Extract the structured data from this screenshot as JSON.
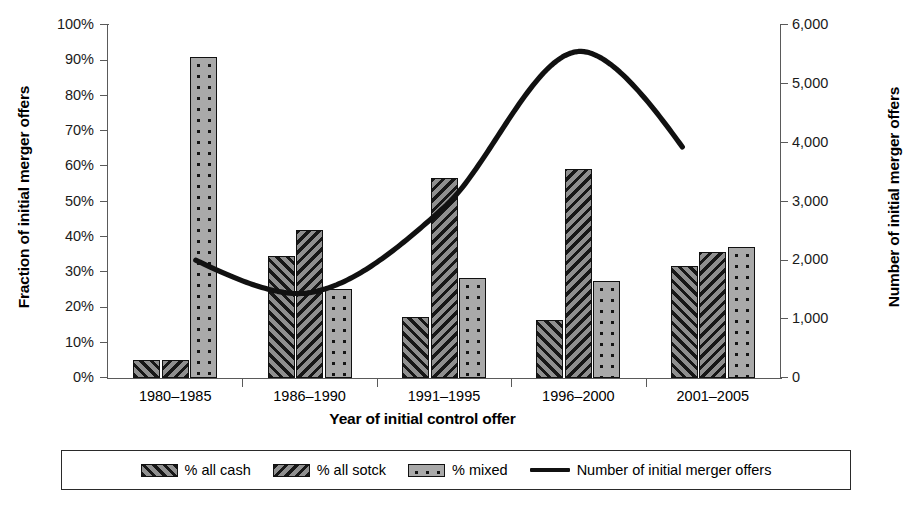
{
  "chart_data": {
    "type": "bar",
    "title": "",
    "xlabel": "Year of initial control offer",
    "ylabel": "Fraction of initial merger offers",
    "y2label": "Number of initial merger offers",
    "categories": [
      "1980–1985",
      "1986–1990",
      "1991–1995",
      "1996–2000",
      "2001–2005"
    ],
    "ylim": [
      0,
      100
    ],
    "y2lim": [
      0,
      6000
    ],
    "yticks": [
      "0%",
      "10%",
      "20%",
      "30%",
      "40%",
      "50%",
      "60%",
      "70%",
      "80%",
      "90%",
      "100%"
    ],
    "y2ticks": [
      "0",
      "1,000",
      "2,000",
      "3,000",
      "4,000",
      "5,000",
      "6,000"
    ],
    "grid": false,
    "legend_position": "bottom",
    "series": [
      {
        "name": "% all cash",
        "pattern": "forward-diagonal-hatch",
        "values": [
          5,
          34.5,
          17.2,
          16.5,
          31.7
        ]
      },
      {
        "name": "% all sotck",
        "pattern": "back-diagonal-hatch",
        "values": [
          5,
          42.0,
          56.8,
          59.3,
          35.6
        ]
      },
      {
        "name": "% mixed",
        "pattern": "dotted",
        "values": [
          91,
          25.2,
          28.3,
          27.4,
          37.2
        ]
      }
    ],
    "line_series": {
      "name": "Number of initial merger offers",
      "axis": "right",
      "x": [
        "1980–1985",
        "1986–1990",
        "1991–1995",
        "1996–2000",
        "2001–2005"
      ],
      "values": [
        2150,
        1450,
        2900,
        5550,
        3250
      ],
      "note": "smooth curve: starts ~2,150, dips to ~1,450 near 1986–1990, rises through ~2,900, peaks ~5,550 just after 1996–2000, falls to ~3,250"
    }
  },
  "axes": {
    "left": {
      "title": "Fraction of initial merger offers",
      "ticks": [
        {
          "label": "100%",
          "value": 100
        },
        {
          "label": "90%",
          "value": 90
        },
        {
          "label": "80%",
          "value": 80
        },
        {
          "label": "70%",
          "value": 70
        },
        {
          "label": "60%",
          "value": 60
        },
        {
          "label": "50%",
          "value": 50
        },
        {
          "label": "40%",
          "value": 40
        },
        {
          "label": "30%",
          "value": 30
        },
        {
          "label": "20%",
          "value": 20
        },
        {
          "label": "10%",
          "value": 10
        },
        {
          "label": "0%",
          "value": 0
        }
      ]
    },
    "right": {
      "title": "Number of initial merger offers",
      "ticks": [
        {
          "label": "6,000",
          "value": 6000
        },
        {
          "label": "5,000",
          "value": 5000
        },
        {
          "label": "4,000",
          "value": 4000
        },
        {
          "label": "3,000",
          "value": 3000
        },
        {
          "label": "2,000",
          "value": 2000
        },
        {
          "label": "1,000",
          "value": 1000
        },
        {
          "label": "0",
          "value": 0
        }
      ]
    },
    "bottom": {
      "title": "Year of initial control offer",
      "categories": [
        "1980–1985",
        "1986–1990",
        "1991–1995",
        "1996–2000",
        "2001–2005"
      ]
    }
  },
  "legend": {
    "items": [
      {
        "label": "% all cash",
        "swatch": "hatch-forward"
      },
      {
        "label": "% all sotck",
        "swatch": "hatch-back"
      },
      {
        "label": "% mixed",
        "swatch": "dots"
      },
      {
        "label": "Number of initial merger offers",
        "swatch": "line"
      }
    ]
  },
  "colors": {
    "bar_cash_fill": "#8f8f8f",
    "bar_stock_fill": "#8f8f8f",
    "bar_mixed_fill": "#a9a9a9",
    "outline": "#111111",
    "axis": "#5a5a5a",
    "line": "#111111",
    "background": "#ffffff"
  }
}
